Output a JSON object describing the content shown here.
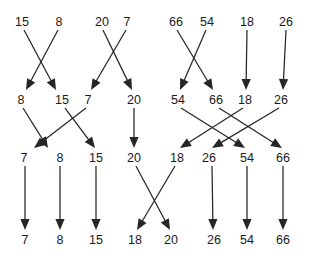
{
  "diagram": {
    "type": "sorting-network-trace",
    "colors": {
      "background": "#ffffff",
      "text": "#1a1a1a",
      "line": "#262626"
    },
    "geometry": {
      "width": 309,
      "height": 261,
      "row_label_y": [
        22,
        100,
        158,
        240
      ],
      "arrow_start_offset": 8,
      "arrow_end_offset": 10
    },
    "rows": [
      {
        "index": 0,
        "name": "row-1-initial",
        "nodes": [
          {
            "id": "r0n0",
            "value": "15",
            "x": 22
          },
          {
            "id": "r0n1",
            "value": "8",
            "x": 59
          },
          {
            "id": "r0n2",
            "value": "20",
            "x": 102
          },
          {
            "id": "r0n3",
            "value": "7",
            "x": 127
          },
          {
            "id": "r0n4",
            "value": "66",
            "x": 176
          },
          {
            "id": "r0n5",
            "value": "54",
            "x": 207
          },
          {
            "id": "r0n6",
            "value": "18",
            "x": 247
          },
          {
            "id": "r0n7",
            "value": "26",
            "x": 286
          }
        ]
      },
      {
        "index": 1,
        "name": "row-2-pairs-sorted",
        "nodes": [
          {
            "id": "r1n0",
            "value": "8",
            "x": 21
          },
          {
            "id": "r1n1",
            "value": "15",
            "x": 62
          },
          {
            "id": "r1n2",
            "value": "7",
            "x": 88
          },
          {
            "id": "r1n3",
            "value": "20",
            "x": 134
          },
          {
            "id": "r1n4",
            "value": "54",
            "x": 178
          },
          {
            "id": "r1n5",
            "value": "66",
            "x": 216
          },
          {
            "id": "r1n6",
            "value": "18",
            "x": 245
          },
          {
            "id": "r1n7",
            "value": "26",
            "x": 281
          }
        ]
      },
      {
        "index": 2,
        "name": "row-3-quads-sorted",
        "nodes": [
          {
            "id": "r2n0",
            "value": "7",
            "x": 24
          },
          {
            "id": "r2n1",
            "value": "8",
            "x": 60
          },
          {
            "id": "r2n2",
            "value": "15",
            "x": 96
          },
          {
            "id": "r2n3",
            "value": "20",
            "x": 134
          },
          {
            "id": "r2n4",
            "value": "18",
            "x": 177
          },
          {
            "id": "r2n5",
            "value": "26",
            "x": 209
          },
          {
            "id": "r2n6",
            "value": "54",
            "x": 247
          },
          {
            "id": "r2n7",
            "value": "66",
            "x": 283
          }
        ]
      },
      {
        "index": 3,
        "name": "row-4-final-sorted",
        "nodes": [
          {
            "id": "r3n0",
            "value": "7",
            "x": 25
          },
          {
            "id": "r3n1",
            "value": "8",
            "x": 60
          },
          {
            "id": "r3n2",
            "value": "15",
            "x": 96
          },
          {
            "id": "r3n3",
            "value": "18",
            "x": 135
          },
          {
            "id": "r3n4",
            "value": "20",
            "x": 171
          },
          {
            "id": "r3n5",
            "value": "26",
            "x": 214
          },
          {
            "id": "r3n6",
            "value": "54",
            "x": 247
          },
          {
            "id": "r3n7",
            "value": "66",
            "x": 283
          }
        ]
      }
    ],
    "arrows": [
      {
        "name": "arrow-r1-15-to-15",
        "from_row": 0,
        "from_x": 24,
        "to_row": 1,
        "to_x": 56,
        "value": "15"
      },
      {
        "name": "arrow-r1-8-to-8",
        "from_row": 0,
        "from_x": 58,
        "to_row": 1,
        "to_x": 26,
        "value": "8"
      },
      {
        "name": "arrow-r1-20-to-20",
        "from_row": 0,
        "from_x": 103,
        "to_row": 1,
        "to_x": 132,
        "value": "20"
      },
      {
        "name": "arrow-r1-7-to-7",
        "from_row": 0,
        "from_x": 126,
        "to_row": 1,
        "to_x": 91,
        "value": "7"
      },
      {
        "name": "arrow-r1-66-to-66",
        "from_row": 0,
        "from_x": 177,
        "to_row": 1,
        "to_x": 213,
        "value": "66"
      },
      {
        "name": "arrow-r1-54-to-54",
        "from_row": 0,
        "from_x": 206,
        "to_row": 1,
        "to_x": 180,
        "value": "54"
      },
      {
        "name": "arrow-r1-18-to-18",
        "from_row": 0,
        "from_x": 247,
        "to_row": 1,
        "to_x": 246,
        "value": "18"
      },
      {
        "name": "arrow-r1-26-to-26",
        "from_row": 0,
        "from_x": 286,
        "to_row": 1,
        "to_x": 283,
        "value": "26"
      },
      {
        "name": "arrow-r2-8-to-8",
        "from_row": 1,
        "from_x": 23,
        "to_row": 2,
        "to_x": 48,
        "value": "8"
      },
      {
        "name": "arrow-r2-15-to-15",
        "from_row": 1,
        "from_x": 65,
        "to_row": 2,
        "to_x": 95,
        "value": "15"
      },
      {
        "name": "arrow-r2-7-to-7",
        "from_row": 1,
        "from_x": 86,
        "to_row": 2,
        "to_x": 34,
        "value": "7"
      },
      {
        "name": "arrow-r2-20-to-20",
        "from_row": 1,
        "from_x": 134,
        "to_row": 2,
        "to_x": 134,
        "value": "20"
      },
      {
        "name": "arrow-r2-54-to-54",
        "from_row": 1,
        "from_x": 181,
        "to_row": 2,
        "to_x": 245,
        "value": "54"
      },
      {
        "name": "arrow-r2-66-to-66",
        "from_row": 1,
        "from_x": 219,
        "to_row": 2,
        "to_x": 282,
        "value": "66"
      },
      {
        "name": "arrow-r2-18-to-18",
        "from_row": 1,
        "from_x": 243,
        "to_row": 2,
        "to_x": 180,
        "value": "18"
      },
      {
        "name": "arrow-r2-26-to-26",
        "from_row": 1,
        "from_x": 279,
        "to_row": 2,
        "to_x": 212,
        "value": "26"
      },
      {
        "name": "arrow-r3-7-to-7",
        "from_row": 2,
        "from_x": 25,
        "to_row": 3,
        "to_x": 25,
        "value": "7"
      },
      {
        "name": "arrow-r3-8-to-8",
        "from_row": 2,
        "from_x": 60,
        "to_row": 3,
        "to_x": 60,
        "value": "8"
      },
      {
        "name": "arrow-r3-15-to-15",
        "from_row": 2,
        "from_x": 96,
        "to_row": 3,
        "to_x": 96,
        "value": "15"
      },
      {
        "name": "arrow-r3-20-to-20",
        "from_row": 2,
        "from_x": 136,
        "to_row": 3,
        "to_x": 170,
        "value": "20"
      },
      {
        "name": "arrow-r3-18-to-18",
        "from_row": 2,
        "from_x": 175,
        "to_row": 3,
        "to_x": 137,
        "value": "18"
      },
      {
        "name": "arrow-r3-26-to-26",
        "from_row": 2,
        "from_x": 212,
        "to_row": 3,
        "to_x": 213,
        "value": "26"
      },
      {
        "name": "arrow-r3-54-to-54",
        "from_row": 2,
        "from_x": 247,
        "to_row": 3,
        "to_x": 247,
        "value": "54"
      },
      {
        "name": "arrow-r3-66-to-66",
        "from_row": 2,
        "from_x": 283,
        "to_row": 3,
        "to_x": 283,
        "value": "66"
      }
    ]
  }
}
